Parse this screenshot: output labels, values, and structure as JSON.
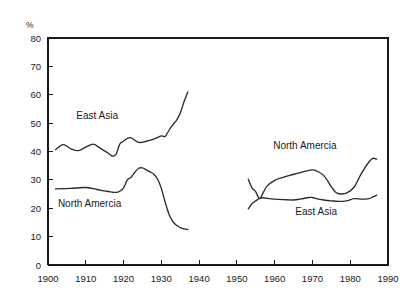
{
  "chart_data": {
    "type": "line",
    "title": "",
    "xlabel": "",
    "ylabel": "%",
    "xlim": [
      1900,
      1990
    ],
    "ylim": [
      0,
      80
    ],
    "xticks": [
      1900,
      1910,
      1920,
      1930,
      1940,
      1950,
      1960,
      1970,
      1980,
      1990
    ],
    "yticks": [
      0,
      10,
      20,
      30,
      40,
      50,
      60,
      70,
      80
    ],
    "grid": false,
    "legend_position": "inline-annotations",
    "series": [
      {
        "name": "East Asia (early period)",
        "label_text": "East Asia",
        "label_x": 1913,
        "label_y": 51.5,
        "x": [
          1902,
          1904,
          1906,
          1908,
          1910,
          1912,
          1914,
          1916,
          1917,
          1918,
          1919,
          1920,
          1921,
          1922,
          1924,
          1926,
          1928,
          1930,
          1931,
          1932,
          1933,
          1934,
          1935,
          1936,
          1937
        ],
        "y": [
          40.6,
          42.4,
          41.0,
          40.3,
          41.5,
          42.6,
          41.0,
          39.4,
          38.4,
          39.0,
          42.6,
          43.6,
          44.6,
          44.8,
          43.2,
          43.6,
          44.4,
          45.5,
          45.3,
          47.4,
          49.4,
          51.0,
          53.5,
          57.5,
          61.0
        ]
      },
      {
        "name": "North Amercia (early period)",
        "label_text": "North Amercia",
        "label_x": 1911,
        "label_y": 20.3,
        "x": [
          1902,
          1906,
          1910,
          1912,
          1914,
          1916,
          1918,
          1919,
          1920,
          1921,
          1922,
          1923,
          1924,
          1925,
          1926,
          1927,
          1928,
          1929,
          1930,
          1931,
          1932,
          1933,
          1934,
          1935,
          1936,
          1937
        ],
        "y": [
          26.8,
          27.0,
          27.3,
          26.9,
          26.3,
          25.9,
          25.6,
          26.0,
          27.2,
          30.0,
          30.9,
          32.7,
          34.1,
          34.2,
          33.5,
          32.8,
          32.0,
          30.3,
          27.0,
          22.2,
          18.0,
          15.4,
          14.0,
          13.2,
          12.7,
          12.5
        ]
      },
      {
        "name": "North Amercia (late period)",
        "label_text": "North Amercia",
        "label_x": 1968,
        "label_y": 40.8,
        "x": [
          1953,
          1954,
          1955,
          1956,
          1957,
          1958,
          1960,
          1962,
          1964,
          1966,
          1968,
          1970,
          1971,
          1973,
          1975,
          1976,
          1977,
          1979,
          1981,
          1983,
          1985,
          1986,
          1987
        ],
        "y": [
          30.2,
          27.2,
          25.8,
          23.4,
          25.6,
          27.8,
          29.8,
          30.8,
          31.6,
          32.3,
          33.0,
          33.5,
          33.2,
          31.5,
          27.6,
          25.8,
          25.1,
          25.3,
          27.4,
          32.4,
          36.4,
          37.6,
          37.3
        ]
      },
      {
        "name": "East Asia (late period)",
        "label_text": "East Asia",
        "label_x": 1971,
        "label_y": 17.6,
        "x": [
          1953,
          1954,
          1955,
          1956,
          1957,
          1959,
          1961,
          1963,
          1965,
          1967,
          1969,
          1970,
          1971,
          1973,
          1975,
          1977,
          1979,
          1981,
          1983,
          1985,
          1986,
          1987
        ],
        "y": [
          19.8,
          21.6,
          22.6,
          23.5,
          23.7,
          23.3,
          23.1,
          23.0,
          22.9,
          23.3,
          23.8,
          23.8,
          23.4,
          22.9,
          22.6,
          22.4,
          22.6,
          23.4,
          23.2,
          23.4,
          24.0,
          24.6
        ]
      }
    ]
  }
}
